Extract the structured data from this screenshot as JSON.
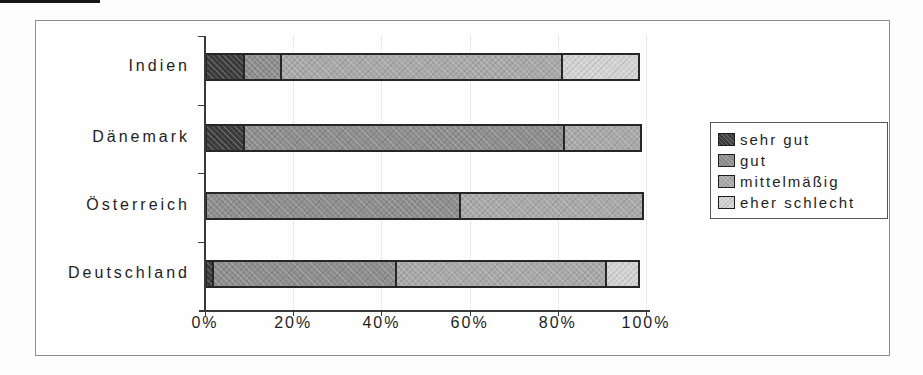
{
  "chart_data": {
    "type": "bar",
    "orientation": "horizontal",
    "stacked": true,
    "title": "",
    "xlabel": "",
    "ylabel": "",
    "categories": [
      "Indien",
      "Dänemark",
      "Österreich",
      "Deutschland"
    ],
    "series": [
      {
        "name": "sehr gut",
        "color": "#3d3d3d",
        "values": [
          9,
          9,
          0,
          2
        ]
      },
      {
        "name": "gut",
        "color": "#8e8e8e",
        "values": [
          9,
          73,
          58,
          42
        ]
      },
      {
        "name": "mittelmäßig",
        "color": "#a9a9a9",
        "values": [
          64,
          18,
          42,
          48
        ]
      },
      {
        "name": "eher schlecht",
        "color": "#d3d3d3",
        "values": [
          18,
          0,
          0,
          8
        ]
      }
    ],
    "x_tick_labels": [
      "0%",
      "20%",
      "40%",
      "60%",
      "80%",
      "100%"
    ],
    "xlim": [
      0,
      100
    ],
    "x_tick_step": 20,
    "grid": "faint dotted vertical lines at 20% steps",
    "legend_position": "right",
    "legend_entries": [
      "sehr gut",
      "gut",
      "mittelmäßig",
      "eher schlecht"
    ]
  }
}
